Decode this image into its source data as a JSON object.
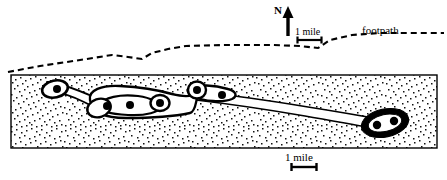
{
  "figure": {
    "kind": "schematic-map",
    "title": "",
    "labels": {
      "north": "N",
      "footpath": "footpath",
      "scale_top": "1 mile",
      "scale_bottom": "1 mile"
    },
    "colors": {
      "ink": "#000000",
      "paper": "#ffffff",
      "stipple": "#1a1a1a",
      "map_fill": "#ffffff"
    },
    "map_frame": {
      "x": 11,
      "y": 75,
      "width": 426,
      "height": 73,
      "fill": "stippled"
    },
    "north_arrow": {
      "x": 288,
      "y_top": 8,
      "y_bottom": 36,
      "direction": "up"
    },
    "scale_bars": [
      {
        "name": "scale-bar-top",
        "x1": 297,
        "x2": 322,
        "y": 40,
        "length_label": "1 mile"
      },
      {
        "name": "scale-bar-bottom",
        "x1": 291,
        "x2": 316,
        "y": 167,
        "length_label": "1 mile"
      }
    ],
    "footpath": {
      "style": "dashed",
      "points": "8,72 40,66 80,60 112,55 128,57 142,59 152,53 168,49 186,46 226,45 272,45 300,46 318,48 330,40 352,35 380,33 420,33 444,33"
    },
    "path_network": {
      "description": "white corridor network with black outline and filled node dots inside the stippled map area",
      "node_dots": [
        {
          "cx": 57,
          "cy": 89,
          "r": 4.0
        },
        {
          "cx": 107,
          "cy": 106,
          "r": 4.0
        },
        {
          "cx": 130,
          "cy": 105,
          "r": 4.0
        },
        {
          "cx": 160,
          "cy": 103,
          "r": 4.0
        },
        {
          "cx": 197,
          "cy": 90,
          "r": 4.0
        },
        {
          "cx": 222,
          "cy": 95,
          "r": 4.0
        },
        {
          "cx": 376,
          "cy": 124,
          "r": 4.2
        },
        {
          "cx": 394,
          "cy": 122,
          "r": 4.2
        }
      ]
    }
  }
}
